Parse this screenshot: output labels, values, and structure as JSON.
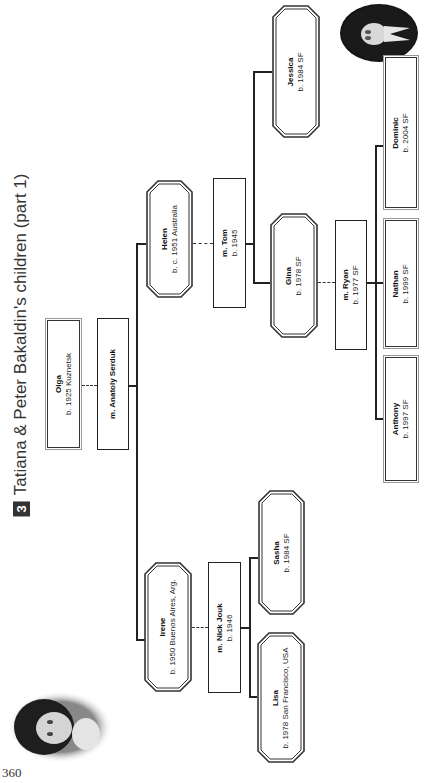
{
  "page": {
    "section_number": "3",
    "title": "Tatiana & Peter Bakaldin's children (part 1)",
    "page_number": "360"
  },
  "photos": [
    {
      "name": "portrait-top-right",
      "description": "oval portrait photo"
    },
    {
      "name": "portrait-bottom-left",
      "description": "oval portrait photo"
    }
  ],
  "people": {
    "olga": {
      "name": "Olga",
      "detail": "b. 1925 Kuznetsk"
    },
    "anatoly": {
      "name": "m. Anatoly Serduk",
      "detail": ""
    },
    "helen": {
      "name": "Helen",
      "detail": "b. c. 1951 Australia"
    },
    "tom": {
      "name": "m. Tom",
      "detail": "b. 1945"
    },
    "jessica": {
      "name": "Jessica",
      "detail": "b. 1984 SF"
    },
    "gina": {
      "name": "Gina",
      "detail": "b. 1978 SF"
    },
    "ryan": {
      "name": "m. Ryan",
      "detail": "b. 1977 SF"
    },
    "dominic": {
      "name": "Dominic",
      "detail": "b. 2004 SF"
    },
    "nathan": {
      "name": "Nathan",
      "detail": "b. 1999 SF"
    },
    "anthony": {
      "name": "Anthony",
      "detail": "b. 1997 SF"
    },
    "irene": {
      "name": "Irene",
      "detail": "b. 1950 Buenos Aires, Arg."
    },
    "nick": {
      "name": "m. Nick Jouk",
      "detail": "b. 1946"
    },
    "sasha": {
      "name": "Sasha",
      "detail": "b. 1984 SF"
    },
    "lisa": {
      "name": "Lisa",
      "detail": "b. 1978 San Francisco, USA"
    }
  }
}
